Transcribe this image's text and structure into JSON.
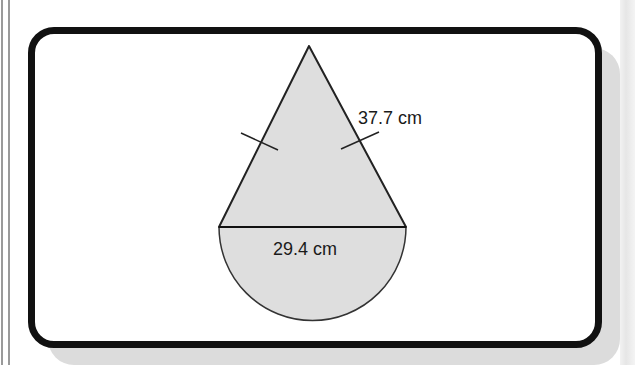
{
  "diagram": {
    "type": "composite shape: isosceles triangle on top of a semicircle",
    "shapes": [
      {
        "name": "triangle",
        "kind": "isosceles",
        "apex": [
          309,
          46
        ],
        "base_left": [
          219,
          227
        ],
        "base_right": [
          406,
          227
        ]
      },
      {
        "name": "semicircle",
        "center": [
          312.5,
          227
        ],
        "radius": 93.5,
        "side": "below"
      }
    ],
    "labels": {
      "slant_side": "37.7 cm",
      "diameter": "29.4 cm"
    },
    "equal_side_ticks": 2,
    "colors": {
      "fill": "#dedede",
      "stroke": "#222222",
      "frame": "#111111",
      "shadow": "#dcdcdc"
    }
  }
}
